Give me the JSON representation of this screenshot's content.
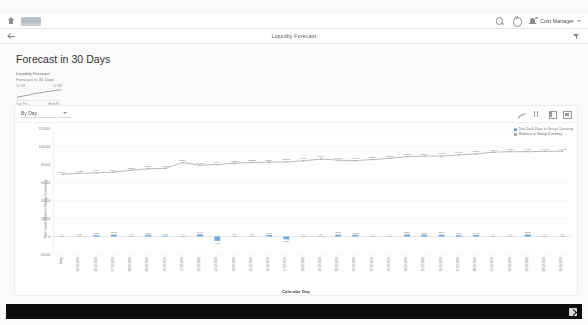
{
  "shell": {
    "home_icon": "home-icon",
    "logo_alt": "company-logo",
    "search_icon": "search-icon",
    "help_icon": "help-icon",
    "notifications_icon": "bell-icon",
    "user_name": "Cost Manager",
    "user_chevron": "chevron-down-icon"
  },
  "pagebar": {
    "back_icon": "back-arrow-icon",
    "title": "Liquidity Forecast",
    "filter_icon": "filter-icon"
  },
  "page": {
    "title": "Forecast in 30 Days"
  },
  "kpi": {
    "title": "Liquidity Forecast",
    "subtitle": "Forecast in 30 Days",
    "value_left": "10.5M",
    "value_right": "12.9M",
    "axis_left": "Tue Fe...",
    "axis_right": "Wed M..."
  },
  "chart_toolbar": {
    "dimension_label": "By Day",
    "dropdown_icon": "chevron-down-icon",
    "icons": [
      {
        "name": "line-chart-icon",
        "label": "Line Chart"
      },
      {
        "name": "column-chart-icon",
        "label": "Column Chart"
      },
      {
        "name": "legend-toggle-icon",
        "label": "Legend"
      },
      {
        "name": "fullscreen-icon",
        "label": "Full Screen"
      }
    ]
  },
  "legend": {
    "items": [
      {
        "label": "Net Cash Flow in Group Currency",
        "color": "#5899da"
      },
      {
        "label": "Balance in Group Currency",
        "color": "#aaaaaa"
      }
    ]
  },
  "chart_data": {
    "type": "line",
    "title": "Forecast in 30 Days",
    "xlabel": "Calendar Day",
    "ylabel": "Net Cash Flow in Group Currency",
    "ylim": [
      -2000,
      12000
    ],
    "yticks": [
      -2000,
      0,
      2000,
      4000,
      6000,
      8000,
      10000,
      12000
    ],
    "ytick_labels": [
      "-2000",
      "0",
      "2000",
      "4000",
      "6000",
      "8000",
      "10000",
      "12000"
    ],
    "grid": true,
    "legend_position": "top-right",
    "categories": [
      "Today",
      "05.02.2019",
      "06.02.2019",
      "07.02.2019",
      "08.02.2019",
      "09.02.2019",
      "10.02.2019",
      "11.02.2019",
      "12.02.2019",
      "13.02.2019",
      "14.02.2019",
      "15.02.2019",
      "16.02.2019",
      "17.02.2019",
      "18.02.2019",
      "19.02.2019",
      "20.02.2019",
      "21.02.2019",
      "22.02.2019",
      "23.02.2019",
      "24.02.2019",
      "25.02.2019",
      "26.02.2019",
      "27.02.2019",
      "28.02.2019",
      "01.03.2019",
      "02.03.2019",
      "03.03.2019",
      "04.03.2019",
      "05.03.2019"
    ],
    "series": [
      {
        "name": "Net Cash Flow in Group Currency",
        "type": "bar",
        "color": "#5899da",
        "values": [
          8,
          12,
          135,
          213,
          14,
          186,
          73,
          6,
          246,
          -489,
          36,
          29,
          157,
          -326,
          8,
          5,
          205,
          172,
          7,
          4,
          231,
          198,
          206,
          139,
          163,
          6,
          5,
          232,
          9,
          11
        ],
        "data_labels": [
          "8",
          "12",
          "135",
          "213",
          "14",
          "186",
          "73",
          "6",
          "246",
          "-489",
          "36",
          "29",
          "157",
          "-326",
          "8",
          "5",
          "205",
          "172",
          "7",
          "4",
          "231",
          "198",
          "206",
          "139",
          "163",
          "6",
          "5",
          "232",
          "9",
          "11"
        ]
      },
      {
        "name": "Balance in Group Currency",
        "type": "line",
        "color": "#9a9a9a",
        "values": [
          6909,
          7022,
          7084,
          7160,
          7368,
          7536,
          7578,
          8224,
          7921,
          7994,
          8159,
          8232,
          8259,
          8293,
          8414,
          8614,
          8492,
          8442,
          8557,
          8681,
          8885,
          8941,
          8948,
          9081,
          9184,
          9377,
          9427,
          9430,
          9470,
          9482
        ],
        "data_labels": [
          "6909",
          "7022",
          "7084",
          "7160",
          "7368",
          "7536",
          "7578",
          "8224",
          "7921",
          "7994",
          "8159",
          "8232",
          "8259",
          "8293",
          "8414",
          "8614",
          "8492",
          "8442",
          "8557",
          "8681",
          "8885",
          "8941",
          "8948",
          "9081",
          "9184",
          "9377",
          "9427",
          "9430",
          "9470",
          "9482"
        ]
      }
    ]
  },
  "footer": {
    "action_icon": "export-icon"
  }
}
